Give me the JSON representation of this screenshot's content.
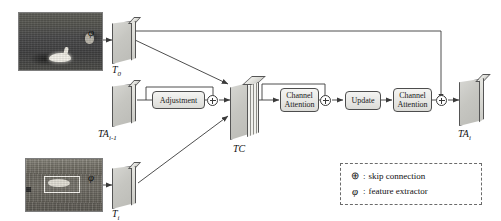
{
  "figure": {
    "type": "neural-network-architecture-diagram",
    "title": "",
    "inputs": [
      {
        "id": "template-frame",
        "photo_name": "swan-on-water-thumbnail",
        "extractor_symbol": "φ",
        "feature_map_label": "T",
        "feature_map_sub": "0"
      },
      {
        "id": "search-frame",
        "photo_name": "boxed-object-in-field-thumbnail",
        "extractor_symbol": "φ",
        "feature_map_label": "T",
        "feature_map_sub": "i"
      }
    ],
    "prev_accum": {
      "label": "TA",
      "sub": "i-1"
    },
    "concat": {
      "label": "TC",
      "sub": ""
    },
    "output": {
      "label": "TA",
      "sub": "i"
    },
    "blocks": [
      {
        "id": "adjustment",
        "label": "Adjustment",
        "lines": [
          "Adjustment"
        ]
      },
      {
        "id": "channel-attention-1",
        "label": "Channel Attention",
        "lines": [
          "Channel",
          "Attention"
        ]
      },
      {
        "id": "update",
        "label": "Update",
        "lines": [
          "Update"
        ]
      },
      {
        "id": "channel-attention-2",
        "label": "Channel Attention",
        "lines": [
          "Channel",
          "Attention"
        ]
      }
    ],
    "skip_nodes": [
      "adjustment-sum",
      "channel-attention-1-sum",
      "final-sum"
    ],
    "legend": {
      "rows": [
        {
          "symbol": "⊕",
          "colon": ":",
          "text": "skip connection"
        },
        {
          "symbol": "φ",
          "colon": ":",
          "text": "feature extractor"
        }
      ]
    },
    "colors": {
      "line": "#3a3a3a",
      "box_border": "#4d4d4d",
      "box_fill": "#ececea",
      "slab_face": "#c6c6c1",
      "legend_border": "#6b6b6b",
      "background": "#ffffff"
    }
  }
}
